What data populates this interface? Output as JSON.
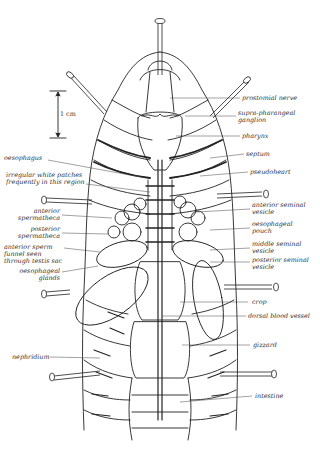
{
  "diagram": {
    "scale_bar": {
      "label": "1 cm"
    },
    "labels_right": [
      {
        "id": "prostomial-nerve",
        "text": "prostomial nerve"
      },
      {
        "id": "supra-pharangeal-ganglion",
        "text": "supra-pharangeal\nganglion"
      },
      {
        "id": "pharynx",
        "text": "pharynx"
      },
      {
        "id": "septum",
        "text": "septum"
      },
      {
        "id": "pseudoheart",
        "text": "pseudoheart"
      },
      {
        "id": "anterior-seminal-vesicle",
        "text": "anterior seminal\nvesicle"
      },
      {
        "id": "oesophageal-pouch",
        "text": "oesophageal\npouch"
      },
      {
        "id": "middle-seminal-vesicle",
        "text": "middle seminal\nvesicle"
      },
      {
        "id": "posterior-seminal-vesicle",
        "text": "posterior seminal\nvesicle"
      },
      {
        "id": "crop",
        "text": "crop"
      },
      {
        "id": "dorsal-blood-vessel",
        "text": "dorsal blood vessel"
      },
      {
        "id": "gizzard",
        "text": "gizzard"
      },
      {
        "id": "intestine",
        "text": "intestine"
      }
    ],
    "labels_left": [
      {
        "id": "oesophagus",
        "text": "oesophagus"
      },
      {
        "id": "irregular-white-patches",
        "text": "irregular white patches\nfrequently in this region"
      },
      {
        "id": "anterior-spermatheca",
        "text": "anterior\nspermatheca"
      },
      {
        "id": "posterior-spermatheca",
        "text": "posterior\nspermatheca"
      },
      {
        "id": "anterior-sperm-funnel",
        "text": "anterior sperm\nfunnel seen\nthrough testis sac"
      },
      {
        "id": "oesophageal-glands",
        "text": "oesophageal\nglands"
      },
      {
        "id": "nephridium",
        "text": "nephridium"
      }
    ]
  }
}
